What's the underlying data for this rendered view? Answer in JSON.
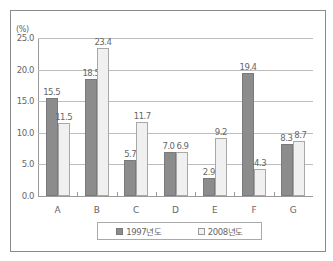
{
  "chart_data": {
    "type": "bar",
    "title": "",
    "xlabel": "",
    "ylabel": "(%)",
    "ylim": [
      0,
      25
    ],
    "yticks": [
      "0.0",
      "5.0",
      "10.0",
      "15.0",
      "20.0",
      "25.0"
    ],
    "grid": true,
    "legend_position": "bottom",
    "categories": [
      "A",
      "B",
      "C",
      "D",
      "E",
      "F",
      "G"
    ],
    "series": [
      {
        "name": "1997년도",
        "color": "#8c8c8c",
        "values": [
          15.5,
          18.5,
          5.7,
          7.0,
          2.9,
          19.4,
          8.3
        ]
      },
      {
        "name": "2008년도",
        "color": "#f0f0f0",
        "values": [
          11.5,
          23.4,
          11.7,
          6.9,
          9.2,
          4.3,
          8.7
        ]
      }
    ],
    "data_labels": [
      [
        "15.5",
        "18.5",
        "5.7",
        "7.0",
        "2.9",
        "19.4",
        "8.3"
      ],
      [
        "11.5",
        "23.4",
        "11.7",
        "6.9",
        "9.2",
        "4.3",
        "8.7"
      ]
    ]
  }
}
